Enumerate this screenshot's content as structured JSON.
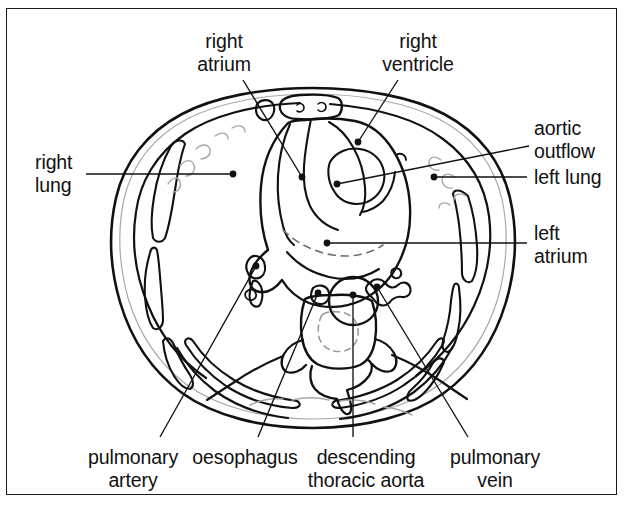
{
  "figure": {
    "kind": "labelled anatomical line drawing",
    "border_color": "#1a1a1a",
    "ink_color": "#111111",
    "faint_ink_color": "#9a9a9a",
    "background": "#ffffff"
  },
  "labels": [
    {
      "id": "right-atrium",
      "text": "right\natrium",
      "line1": "right",
      "line2": "atrium",
      "align": "center",
      "x": 224,
      "y": 30,
      "dot_x": 302,
      "dot_y": 177,
      "anchor_x": 243,
      "anchor_y": 80
    },
    {
      "id": "right-ventricle",
      "text": "right\nventricle",
      "line1": "right",
      "line2": "ventricle",
      "align": "center",
      "x": 418,
      "y": 30,
      "dot_x": 358,
      "dot_y": 142,
      "anchor_x": 398,
      "anchor_y": 80
    },
    {
      "id": "aortic-outflow",
      "text": "aortic\noutflow",
      "line1": "aortic",
      "line2": "outflow",
      "align": "left",
      "x": 534,
      "y": 117,
      "dot_x": 337,
      "dot_y": 184,
      "anchor_x": 529,
      "anchor_y": 146
    },
    {
      "id": "right-lung",
      "text": "right\nlung",
      "line1": "right",
      "line2": "lung",
      "align": "left",
      "x": 35,
      "y": 151,
      "dot_x": 233,
      "dot_y": 174,
      "anchor_x": 86,
      "anchor_y": 174
    },
    {
      "id": "left-lung",
      "text": "left lung",
      "line1": "left lung",
      "line2": "",
      "align": "left",
      "x": 534,
      "y": 166,
      "dot_x": 434,
      "dot_y": 177,
      "anchor_x": 527,
      "anchor_y": 177
    },
    {
      "id": "left-atrium",
      "text": "left\natrium",
      "line1": "left",
      "line2": "atrium",
      "align": "left",
      "x": 534,
      "y": 222,
      "dot_x": 327,
      "dot_y": 243,
      "anchor_x": 527,
      "anchor_y": 243
    },
    {
      "id": "pulmonary-artery",
      "text": "pulmonary\nartery",
      "line1": "pulmonary",
      "line2": "artery",
      "align": "center",
      "x": 133,
      "y": 446,
      "dot_x": 256,
      "dot_y": 266,
      "anchor_x": 160,
      "anchor_y": 437
    },
    {
      "id": "oesophagus",
      "text": "oesophagus",
      "line1": "oesophagus",
      "line2": "",
      "align": "center",
      "x": 245,
      "y": 446,
      "dot_x": 318,
      "dot_y": 293,
      "anchor_x": 258,
      "anchor_y": 437
    },
    {
      "id": "descending-thoracic-aorta",
      "text": "descending\nthoracic aorta",
      "line1": "descending",
      "line2": "thoracic aorta",
      "align": "center",
      "x": 366,
      "y": 446,
      "dot_x": 353,
      "dot_y": 295,
      "anchor_x": 353,
      "anchor_y": 437
    },
    {
      "id": "pulmonary-vein",
      "text": "pulmonary\nvein",
      "line1": "pulmonary",
      "line2": "vein",
      "align": "center",
      "x": 495,
      "y": 446,
      "dot_x": 377,
      "dot_y": 287,
      "anchor_x": 468,
      "anchor_y": 437
    }
  ]
}
